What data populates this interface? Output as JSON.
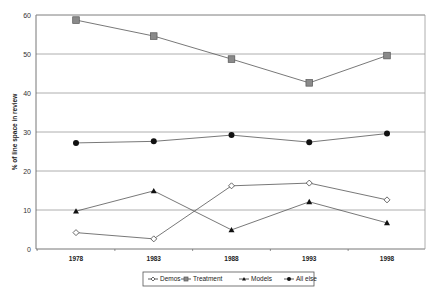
{
  "chart_data": {
    "type": "line",
    "title": "",
    "xlabel": "",
    "ylabel": "% of line space in review",
    "categories": [
      "1978",
      "1983",
      "1988",
      "1993",
      "1998"
    ],
    "ylim": [
      0,
      60
    ],
    "yticks": [
      0,
      10,
      20,
      30,
      40,
      50,
      60
    ],
    "grid": true,
    "legend_position": "bottom",
    "series": [
      {
        "name": "Demos",
        "marker": "diamond-open",
        "color": "#555555",
        "values": [
          4.2,
          2.6,
          16.2,
          16.9,
          12.6
        ]
      },
      {
        "name": "Treatment",
        "marker": "square",
        "color": "#777777",
        "values": [
          58.7,
          54.6,
          48.7,
          42.6,
          49.6
        ]
      },
      {
        "name": "Models",
        "marker": "triangle",
        "color": "#111111",
        "values": [
          9.7,
          14.9,
          4.9,
          12.1,
          6.7
        ]
      },
      {
        "name": "All else",
        "marker": "circle",
        "color": "#111111",
        "values": [
          27.2,
          27.6,
          29.2,
          27.4,
          29.6
        ]
      }
    ]
  },
  "colors": {
    "background": "#ffffff",
    "gridline": "#9a9a9a",
    "axis": "#666666",
    "line": "#555555",
    "treatment_fill": "#8a8a8a"
  }
}
